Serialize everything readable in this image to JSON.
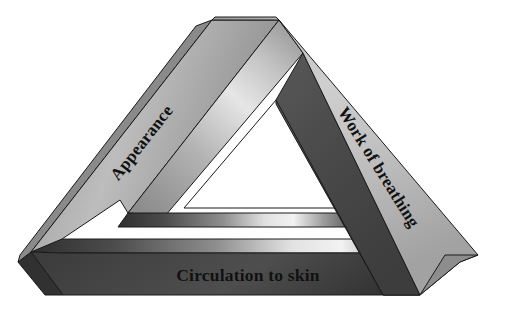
{
  "figure": {
    "name": "pediatric-assessment-triangle",
    "shape": "penrose-impossible-triangle",
    "background_color": "#ffffff",
    "labels": {
      "left": "Appearance",
      "right": "Work of breathing",
      "bottom": "Circulation to skin"
    },
    "label_rotation_deg": {
      "left": -60,
      "right": 60,
      "bottom": 0
    },
    "colors": {
      "left_bar_light": "#c9c9c9",
      "left_bar_mid": "#a8a8a8",
      "left_bar_dark": "#8e8e8e",
      "left_bar_highlight": "#e8e8e8",
      "right_bar_light": "#d2d2d2",
      "right_bar_mid": "#b0b0b0",
      "right_inner_dark": "#4a4a4a",
      "bottom_bar_dark": "#3a3a3a",
      "bottom_bar_darker": "#2e2e2e",
      "bottom_highlight": "#efefef",
      "inner_hole": "#ffffff",
      "outline": "#1a1a1a",
      "text": "#111111"
    }
  }
}
